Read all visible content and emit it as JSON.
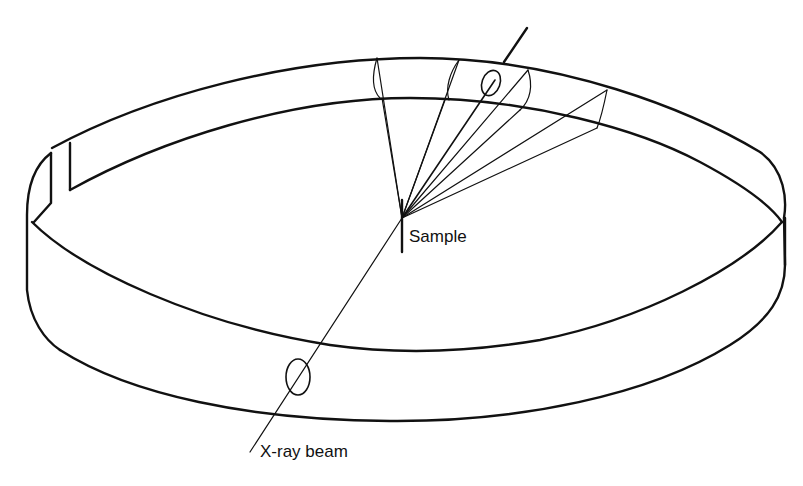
{
  "figure": {
    "type": "Debye-Scherrer powder camera schematic",
    "labels": {
      "sample": "Sample",
      "xray_beam": "X-ray beam"
    },
    "components": [
      {
        "name": "cylindrical-film-ring",
        "description": "Film strip wrapped around the inside of a cylindrical camera"
      },
      {
        "name": "sample",
        "description": "Point sample at the center of the camera"
      },
      {
        "name": "entrance-collimator-hole",
        "description": "Hole in the film where the X-ray beam enters"
      },
      {
        "name": "exit-beam-hole",
        "description": "Hole in the film where the undiffracted beam exits"
      },
      {
        "name": "diffraction-cones",
        "description": "Cones of diffracted rays fanning out from the sample to the film"
      },
      {
        "name": "film-slot",
        "description": "Gap in the film strip at the left"
      }
    ],
    "colors": {
      "line": "#111111",
      "background": "#ffffff"
    }
  }
}
